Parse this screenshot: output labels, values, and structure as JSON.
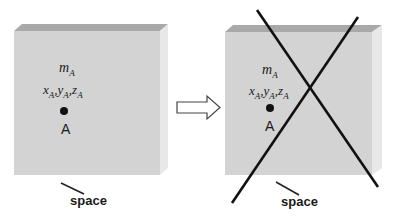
{
  "diagram": {
    "left_panel": {
      "mass_label": {
        "base": "m",
        "sub": "A"
      },
      "coords_label": {
        "x": "x",
        "y": "y",
        "z": "z",
        "sub": "A",
        "sep": ","
      },
      "point_label": "A",
      "caption": "space"
    },
    "arrow": "right-arrow",
    "right_panel": {
      "mass_label": {
        "base": "m",
        "sub": "A"
      },
      "coords_label": {
        "x": "x",
        "y": "y",
        "z": "z",
        "sub": "A",
        "sep": ","
      },
      "point_label": "A",
      "caption": "space",
      "crossed_out": true
    },
    "colors": {
      "box_front": "#d3d3d3",
      "box_top": "#a9a9a9",
      "box_side": "#e6e6e6",
      "ink": "#111111"
    }
  }
}
